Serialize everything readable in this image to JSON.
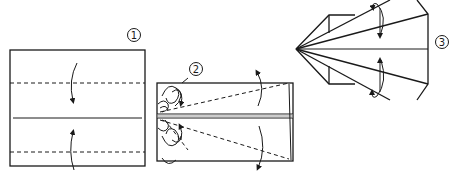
{
  "diagram": {
    "type": "origami-instructions",
    "steps": [
      {
        "number": "1",
        "description": "Square with two horizontal valley-fold lines; fold top and bottom edges to center line",
        "fold_lines": [
          "dashed-top",
          "solid-center",
          "dashed-bottom"
        ],
        "arrows": [
          "fold-down-arrow",
          "fold-up-arrow"
        ]
      },
      {
        "number": "2",
        "description": "Rectangle folded to center; dashed diagonal fold lines from left center to right corners; squash folds at left",
        "fold_lines": [
          "dashed-diagonal-top",
          "dashed-diagonal-bottom",
          "double-center-line"
        ],
        "arrows": [
          "fold-back-top-arrow",
          "fold-back-bottom-arrow"
        ]
      },
      {
        "number": "3",
        "description": "Pointed shape with radiating lines from left apex; fold flaps behind",
        "arrows": [
          "fold-behind-top-arrow",
          "fold-behind-bottom-arrow"
        ]
      }
    ],
    "colors": {
      "line": "#1a1a1a",
      "background": "#ffffff"
    }
  }
}
